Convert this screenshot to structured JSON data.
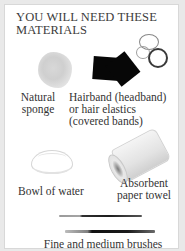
{
  "header": {
    "title": "YOU WILL NEED THESE MATERIALS"
  },
  "materials": [
    {
      "label": "Natural sponge",
      "icon": "sponge-icon"
    },
    {
      "label": "Hairband (headband) or hair elastics (covered bands)",
      "icon": "hairband-icon"
    },
    {
      "label": "Bowl of water",
      "icon": "bowl-icon"
    },
    {
      "label": "Absorbent paper towel",
      "icon": "paper-towel-icon"
    },
    {
      "label": "Fine and medium brushes",
      "icon": "brushes-icon"
    }
  ],
  "labels": {
    "sponge_line1": "Natural",
    "sponge_line2": "sponge",
    "hair_line1": "Hairband (headband)",
    "hair_line2": "or hair elastics",
    "hair_line3": "(covered bands)",
    "bowl": "Bowl of water",
    "towel_line1": "Absorbent",
    "towel_line2": "paper towel",
    "brushes": "Fine and medium brushes"
  },
  "colors": {
    "background": "#e9e9e9",
    "panel": "#ffffff",
    "text": "#3a3a3a",
    "cloth": "#070707"
  }
}
